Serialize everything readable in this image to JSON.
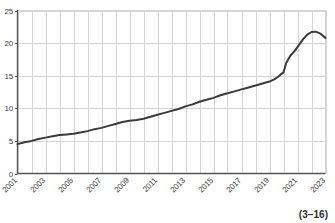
{
  "chart_data": {
    "type": "line",
    "title": "",
    "subtitle": "",
    "xlabel": "",
    "ylabel": "",
    "xlim": [
      2001,
      2023
    ],
    "ylim": [
      0,
      25
    ],
    "grid": true,
    "legend": null,
    "axis_color": "#555555",
    "grid_color": "#d4d4d4",
    "line_color": "#3a3a3a",
    "line_width": 2.0,
    "ytick_labels": [
      "0",
      "5",
      "10",
      "15",
      "20",
      "25"
    ],
    "ytick_values": [
      0,
      5,
      10,
      15,
      20,
      25
    ],
    "xtick_labels": [
      "2001",
      "2003",
      "2005",
      "2007",
      "2009",
      "2011",
      "2013",
      "2015",
      "2017",
      "2019",
      "2021",
      "2023"
    ],
    "xtick_values": [
      2001,
      2003,
      2005,
      2007,
      2009,
      2011,
      2013,
      2015,
      2017,
      2019,
      2021,
      2023
    ],
    "xtick_rotation": 45,
    "series": [
      {
        "name": "series-1",
        "x": [
          2001,
          2001.5,
          2002,
          2002.5,
          2003,
          2003.5,
          2004,
          2004.5,
          2005,
          2005.5,
          2006,
          2006.5,
          2007,
          2007.5,
          2008,
          2008.5,
          2009,
          2009.5,
          2010,
          2010.5,
          2011,
          2011.5,
          2012,
          2012.5,
          2013,
          2013.5,
          2014,
          2014.5,
          2015,
          2015.5,
          2016,
          2016.5,
          2017,
          2017.5,
          2018,
          2018.5,
          2019,
          2019.3,
          2019.6,
          2019.8,
          2020.0,
          2020.2,
          2020.5,
          2020.8,
          2021.1,
          2021.4,
          2021.7,
          2022.0,
          2022.3,
          2022.6,
          2023.0
        ],
        "values": [
          4.5,
          4.8,
          5.0,
          5.3,
          5.5,
          5.7,
          5.9,
          6.0,
          6.1,
          6.3,
          6.5,
          6.8,
          7.0,
          7.3,
          7.6,
          7.9,
          8.1,
          8.2,
          8.4,
          8.7,
          9.0,
          9.3,
          9.6,
          9.9,
          10.3,
          10.6,
          11.0,
          11.3,
          11.6,
          12.0,
          12.3,
          12.6,
          12.9,
          13.2,
          13.5,
          13.8,
          14.1,
          14.4,
          14.8,
          15.2,
          15.5,
          17.0,
          18.1,
          18.8,
          19.7,
          20.6,
          21.3,
          21.7,
          21.75,
          21.5,
          20.8
        ]
      }
    ]
  },
  "caption": {
    "text": "(3−16)"
  }
}
